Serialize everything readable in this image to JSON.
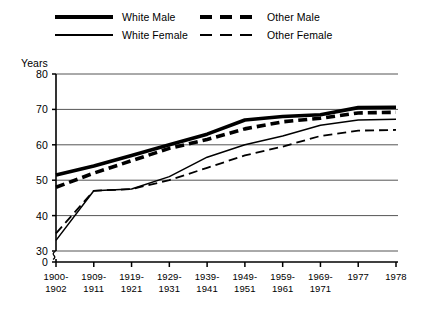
{
  "chart_data": {
    "type": "line",
    "title": "",
    "xlabel": "",
    "ylabel": "Years",
    "ylim": [
      30,
      80
    ],
    "yticks": [
      30,
      40,
      50,
      60,
      70,
      80
    ],
    "axis_break": true,
    "axis_break_zero_label": "0",
    "grid": true,
    "legend_position": "top",
    "categories": [
      "1900-\n1902",
      "1909-\n1911",
      "1919-\n1921",
      "1929-\n1931",
      "1939-\n1941",
      "1949-\n1951",
      "1959-\n1961",
      "1969-\n1971",
      "1977",
      "1978"
    ],
    "series": [
      {
        "name": "White Male",
        "style": "thick-solid",
        "color": "#000000",
        "values": [
          51.5,
          54.0,
          57.0,
          60.0,
          63.0,
          67.0,
          68.0,
          68.5,
          70.5,
          70.6
        ]
      },
      {
        "name": "White Female",
        "style": "thin-solid",
        "color": "#000000",
        "values": [
          33.0,
          47.0,
          47.5,
          51.0,
          56.5,
          60.0,
          62.5,
          65.5,
          67.0,
          67.2
        ]
      },
      {
        "name": "Other Male",
        "style": "thick-dashed",
        "color": "#000000",
        "values": [
          48.0,
          52.0,
          55.5,
          59.0,
          61.5,
          64.5,
          66.5,
          67.5,
          69.0,
          69.2
        ]
      },
      {
        "name": "Other Female",
        "style": "thin-dashed",
        "color": "#000000",
        "values": [
          35.0,
          47.0,
          47.5,
          50.0,
          53.5,
          57.0,
          59.5,
          62.5,
          64.0,
          64.2
        ]
      }
    ]
  },
  "legend": {
    "entries": [
      {
        "label": "White Male",
        "style": "thick-solid",
        "row": 0,
        "col": 0
      },
      {
        "label": "Other Male",
        "style": "thick-dashed",
        "row": 0,
        "col": 1
      },
      {
        "label": "White Female",
        "style": "thin-solid",
        "row": 1,
        "col": 0
      },
      {
        "label": "Other Female",
        "style": "thin-dashed",
        "row": 1,
        "col": 1
      }
    ]
  },
  "axes": {
    "y_axis_title": "Years",
    "y_tick_labels": [
      "80",
      "70",
      "60",
      "50",
      "40",
      "30",
      "0"
    ],
    "x_tick_labels": [
      [
        "1900-",
        "1902"
      ],
      [
        "1909-",
        "1911"
      ],
      [
        "1919-",
        "1921"
      ],
      [
        "1929-",
        "1931"
      ],
      [
        "1939-",
        "1941"
      ],
      [
        "1949-",
        "1951"
      ],
      [
        "1959-",
        "1961"
      ],
      [
        "1969-",
        "1971"
      ],
      [
        "1977",
        ""
      ],
      [
        "1978",
        ""
      ]
    ]
  },
  "colors": {
    "ink": "#000000",
    "grid": "#555555",
    "background": "#ffffff"
  }
}
